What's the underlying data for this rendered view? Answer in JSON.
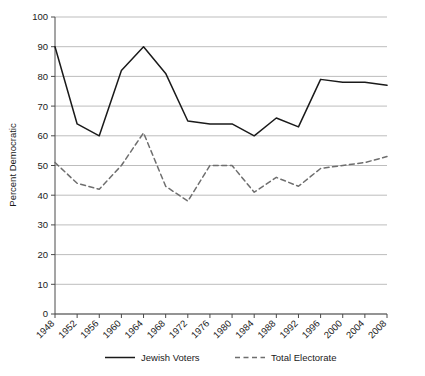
{
  "chart_data": {
    "type": "line",
    "title": "",
    "xlabel": "",
    "ylabel": "Percent Democratic",
    "x": [
      1948,
      1952,
      1956,
      1960,
      1964,
      1968,
      1972,
      1976,
      1980,
      1984,
      1988,
      1992,
      1996,
      2000,
      2004,
      2008
    ],
    "categories": [
      "1948",
      "1952",
      "1956",
      "1960",
      "1964",
      "1968",
      "1972",
      "1976",
      "1980",
      "1984",
      "1988",
      "1992",
      "1996",
      "2000",
      "2004",
      "2008"
    ],
    "series": [
      {
        "name": "Jewish Voters",
        "style": "solid",
        "color": "#1a1a1a",
        "values": [
          90,
          64,
          60,
          82,
          90,
          81,
          65,
          64,
          64,
          60,
          66,
          63,
          79,
          78,
          78,
          77
        ]
      },
      {
        "name": "Total Electorate",
        "style": "dashed",
        "color": "#6e6e6e",
        "values": [
          51,
          44,
          42,
          50,
          61,
          43,
          38,
          50,
          50,
          41,
          46,
          43,
          49,
          50,
          51,
          53
        ]
      }
    ],
    "ylim": [
      0,
      100
    ],
    "yticks": [
      0,
      10,
      20,
      30,
      40,
      50,
      60,
      70,
      80,
      90,
      100
    ],
    "ytick_labels": [
      "0",
      "10",
      "20",
      "30",
      "40",
      "50",
      "60",
      "70",
      "80",
      "90",
      "100"
    ],
    "xtick_labels": [
      "1948",
      "1952",
      "1956",
      "1960",
      "1964",
      "1968",
      "1972",
      "1976",
      "1980",
      "1984",
      "1988",
      "1992",
      "1996",
      "2000",
      "2004",
      "2008"
    ],
    "grid": true,
    "grid_axis": "y",
    "grid_color": "#b5b5b5",
    "legend_position": "bottom",
    "legend": [
      {
        "label": "Jewish Voters",
        "style": "solid"
      },
      {
        "label": "Total Electorate",
        "style": "dashed"
      }
    ],
    "background": "#ffffff",
    "axis_color": "#4a4a4a"
  }
}
